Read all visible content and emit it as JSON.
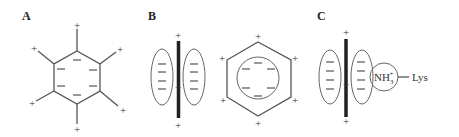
{
  "panels": {
    "a": {
      "label": "A",
      "description": "benzene ring with negative pi-electron face and positive edge hydrogens",
      "center_charge": "−",
      "edge_charge": "+",
      "negative_count": 6,
      "positive_count": 6
    },
    "b": {
      "label": "B",
      "description": "side view (quadrupole) and top view of aromatic ring",
      "side_view": {
        "negative_count": 8,
        "positive_count": 3
      },
      "top_view": {
        "negative_count": 6,
        "positive_count": 6
      }
    },
    "c": {
      "label": "C",
      "description": "cation-pi interaction between aromatic ring and lysine ammonium",
      "cation_label": "NH",
      "cation_sub": "3",
      "cation_sup": "+",
      "residue_label": "Lys"
    }
  },
  "signs": {
    "plus": "+",
    "minus": "−"
  },
  "colors": {
    "line": "#555555",
    "bar": "#222222",
    "background": "#ffffff"
  }
}
